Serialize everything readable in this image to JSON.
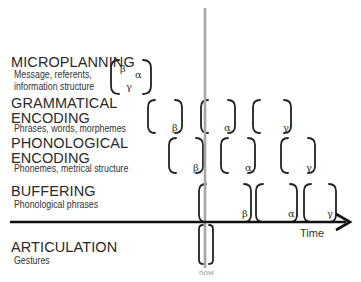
{
  "stages": [
    {
      "title": "MICROPLANNING",
      "subtitle": "Message, referents,\ninformation structure",
      "elements": [
        "β",
        "α",
        "γ"
      ]
    },
    {
      "title": "GRAMMATICAL\nENCODING",
      "subtitle": "Phrases, words, morphemes",
      "elements": [
        "β",
        "α",
        "γ"
      ]
    },
    {
      "title": "PHONOLOGICAL\nENCODING",
      "subtitle": "Phonemes, metrical structure",
      "elements": [
        "β",
        "α",
        "γ"
      ]
    },
    {
      "title": "BUFFERING",
      "subtitle": "Phonological phrases",
      "elements": [
        "β",
        "α",
        "γ"
      ]
    },
    {
      "title": "ARTICULATION",
      "subtitle": "Gestures",
      "elements": []
    }
  ],
  "axis": {
    "label": "Time"
  },
  "now_marker": {
    "label": "now",
    "color": "#a0a0a0"
  },
  "colors": {
    "bracket": "#222222",
    "axis": "#111111"
  }
}
